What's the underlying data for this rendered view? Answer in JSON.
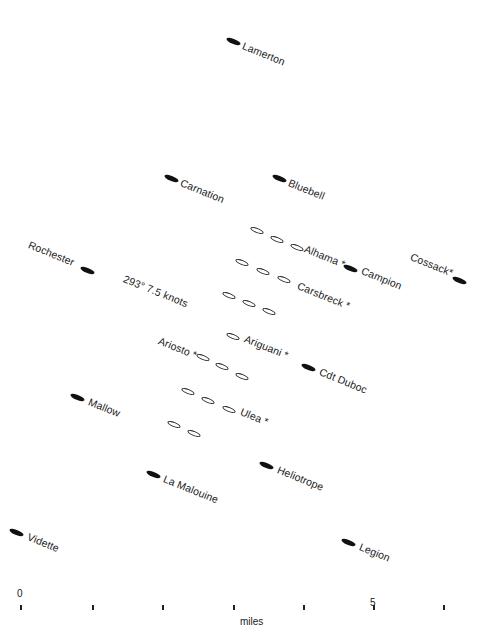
{
  "diagram": {
    "type": "convoy formation plot",
    "heading_rotation_deg": 22,
    "course_label": "293° 7.5 knots",
    "escorts": [
      {
        "name": "Lamerton",
        "x": 233,
        "y": 41,
        "label_dx": 10,
        "label_dy": 2
      },
      {
        "name": "Carnation",
        "x": 171,
        "y": 178,
        "label_dx": 10,
        "label_dy": 2
      },
      {
        "name": "Bluebell",
        "x": 279,
        "y": 178,
        "label_dx": 10,
        "label_dy": 2
      },
      {
        "name": "Campion",
        "x": 350,
        "y": 268,
        "label_dx": 12,
        "label_dy": 0
      },
      {
        "name": "Cossack*",
        "x": 459,
        "y": 280,
        "label_dx": -48,
        "label_dy": -26
      },
      {
        "name": "Rochester",
        "x": 87,
        "y": 270,
        "label_dx": -58,
        "label_dy": -28
      },
      {
        "name": "Cdt Duboc",
        "x": 308,
        "y": 367,
        "label_dx": 12,
        "label_dy": 2
      },
      {
        "name": "Mallow",
        "x": 77,
        "y": 397,
        "label_dx": 12,
        "label_dy": 2
      },
      {
        "name": "La Malouine",
        "x": 153,
        "y": 474,
        "label_dx": 11,
        "label_dy": 2
      },
      {
        "name": "Heliotrope",
        "x": 266,
        "y": 465,
        "label_dx": 12,
        "label_dy": 2
      },
      {
        "name": "Vidette",
        "x": 16,
        "y": 532,
        "label_dx": 12,
        "label_dy": 2
      },
      {
        "name": "Legion",
        "x": 348,
        "y": 542,
        "label_dx": 12,
        "label_dy": 2
      }
    ],
    "merchants": [
      {
        "x": 257,
        "y": 230
      },
      {
        "x": 277,
        "y": 239
      },
      {
        "x": 297,
        "y": 247
      },
      {
        "x": 242,
        "y": 262
      },
      {
        "x": 263,
        "y": 271
      },
      {
        "x": 284,
        "y": 279
      },
      {
        "x": 229,
        "y": 295
      },
      {
        "x": 249,
        "y": 303
      },
      {
        "x": 269,
        "y": 311
      },
      {
        "x": 233,
        "y": 336
      },
      {
        "x": 203,
        "y": 357
      },
      {
        "x": 222,
        "y": 366
      },
      {
        "x": 242,
        "y": 376
      },
      {
        "x": 188,
        "y": 391
      },
      {
        "x": 208,
        "y": 400
      },
      {
        "x": 229,
        "y": 409
      },
      {
        "x": 174,
        "y": 424
      },
      {
        "x": 194,
        "y": 433
      }
    ],
    "merchant_labels": [
      {
        "text": "Alhama *",
        "x": 305,
        "y": 242
      },
      {
        "text": "Carsbreck *",
        "x": 298,
        "y": 279
      },
      {
        "text": "Ariguani *",
        "x": 245,
        "y": 332
      },
      {
        "text": "Ariosto *",
        "x": 159,
        "y": 334
      },
      {
        "text": "Ulea *",
        "x": 241,
        "y": 405
      }
    ],
    "course": {
      "text": "293° 7.5 knots",
      "x": 124,
      "y": 272
    }
  },
  "scale": {
    "unit_label": "miles",
    "start_label": "0",
    "mid_label": "5",
    "ticks_x": [
      20,
      92,
      162,
      233,
      303,
      373,
      443
    ],
    "tick_y": 605,
    "start_label_pos": {
      "x": 17,
      "y": 588
    },
    "mid_label_pos": {
      "x": 370,
      "y": 597
    },
    "unit_label_pos": {
      "x": 240,
      "y": 616
    }
  }
}
